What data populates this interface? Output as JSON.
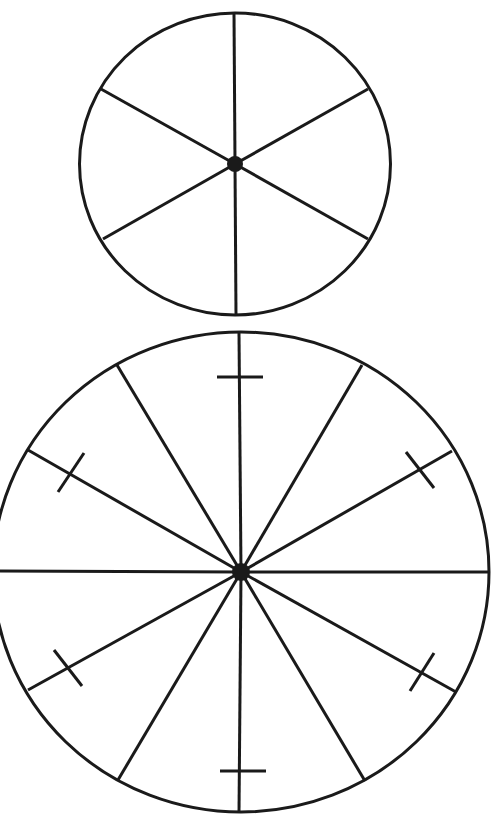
{
  "diagram": {
    "background": "#ffffff",
    "stroke_color": "#1a1a1a",
    "wheels": [
      {
        "name": "six-spoke-wheel",
        "cx": 235,
        "cy": 164,
        "rx": 155.5,
        "ry": 151,
        "rim_stroke_width": 3,
        "spoke_stroke_width": 3,
        "hub_radius": 8,
        "spokes": [
          {
            "x": 234,
            "y": 13
          },
          {
            "x": 368,
            "y": 89
          },
          {
            "x": 368,
            "y": 239
          },
          {
            "x": 236,
            "y": 315
          },
          {
            "x": 103,
            "y": 239
          },
          {
            "x": 101,
            "y": 89
          }
        ],
        "ticks": []
      },
      {
        "name": "twelve-spoke-wheel",
        "cx": 241,
        "cy": 572,
        "rx": 248,
        "ry": 240,
        "rim_stroke_width": 3,
        "spoke_stroke_width": 3,
        "hub_radius": 9,
        "spokes": [
          {
            "x": 239,
            "y": 333
          },
          {
            "x": 362,
            "y": 365
          },
          {
            "x": 452,
            "y": 451
          },
          {
            "x": 488,
            "y": 572
          },
          {
            "x": 456,
            "y": 692
          },
          {
            "x": 365,
            "y": 781
          },
          {
            "x": 239,
            "y": 813
          },
          {
            "x": 118,
            "y": 780
          },
          {
            "x": 28,
            "y": 690
          },
          {
            "x": -7,
            "y": 571
          },
          {
            "x": 28,
            "y": 450
          },
          {
            "x": 117,
            "y": 365
          }
        ],
        "ticks": [
          {
            "x1": 217,
            "y1": 377,
            "x2": 263,
            "y2": 377
          },
          {
            "x1": 406,
            "y1": 452,
            "x2": 434,
            "y2": 488
          },
          {
            "x1": 410,
            "y1": 691,
            "x2": 434,
            "y2": 653
          },
          {
            "x1": 220,
            "y1": 771,
            "x2": 266,
            "y2": 771
          },
          {
            "x1": 54,
            "y1": 650,
            "x2": 82,
            "y2": 686
          },
          {
            "x1": 58,
            "y1": 492,
            "x2": 84,
            "y2": 453
          }
        ]
      }
    ]
  }
}
